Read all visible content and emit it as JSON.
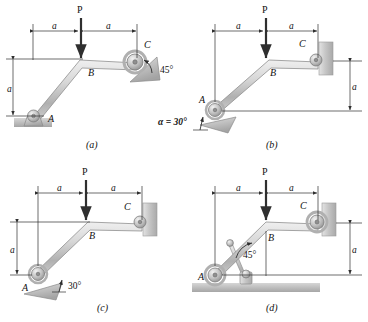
{
  "figure": {
    "type": "engineering-statics-diagram",
    "background_color": "#ffffff",
    "member_color": "#c9c9c9",
    "member_edge_color": "#8a8a8a",
    "ground_color": "#b5b5b5",
    "wall_color": "#c4c4c4",
    "line_color": "#3a3a3a",
    "text_color": "#1a1a1a"
  },
  "panels": [
    {
      "id": "a",
      "caption": "(a)",
      "labels": {
        "load": "P",
        "joint_a": "A",
        "joint_b": "B",
        "joint_c": "C",
        "dim_left": "a",
        "dim_right": "a",
        "dim_vertical": "a",
        "angle": "45°"
      },
      "support_a": "pin-on-ground",
      "support_c": "roller-on-45deg-incline"
    },
    {
      "id": "b",
      "caption": "(b)",
      "labels": {
        "load": "P",
        "joint_a": "A",
        "joint_b": "B",
        "joint_c": "C",
        "dim_left": "a",
        "dim_right": "a",
        "dim_vertical": "a",
        "angle": "α = 30°"
      },
      "support_a": "roller-on-30deg-incline",
      "support_c": "pin-on-wall"
    },
    {
      "id": "c",
      "caption": "(c)",
      "labels": {
        "load": "P",
        "joint_a": "A",
        "joint_b": "B",
        "joint_c": "C",
        "dim_left": "a",
        "dim_right": "a",
        "dim_vertical": "a",
        "angle": "30°"
      },
      "support_a": "roller-on-30deg-incline",
      "support_c": "pin-on-wall"
    },
    {
      "id": "d",
      "caption": "(d)",
      "labels": {
        "load": "P",
        "joint_a": "A",
        "joint_b": "B",
        "joint_c": "C",
        "dim_left": "a",
        "dim_right": "a",
        "dim_vertical": "a",
        "angle": "45°"
      },
      "support_a": "roller-on-ground",
      "support_c": "roller-on-wall",
      "extra": "45-degree-brace-to-ground-pin"
    }
  ]
}
